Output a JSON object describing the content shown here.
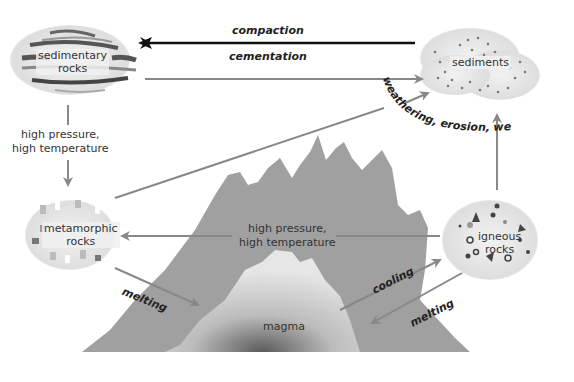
{
  "nodes": {
    "sedimentary": {
      "label_line1": "sedimentary",
      "label_line2": "rocks"
    },
    "sediments": {
      "label": "sediments"
    },
    "metamorphic": {
      "label_line1": "metamorphic",
      "label_line2": "rocks"
    },
    "igneous": {
      "label_line1": "igneous",
      "label_line2": "rocks"
    },
    "magma": {
      "label": "magma"
    }
  },
  "processes": {
    "compaction": "compaction",
    "cementation": "cementation",
    "weathering_arc": "weathering, erosion, weathering",
    "sed_to_meta_line1": "high pressure,",
    "sed_to_meta_line2": "high temperature",
    "ign_to_meta_line1": "high pressure,",
    "ign_to_meta_line2": "high temperature",
    "meta_melting": "melting",
    "cooling": "cooling",
    "ign_melting": "melting"
  },
  "colors": {
    "arrow_dark": "#111111",
    "arrow_gray": "#888888",
    "mountain_outer": "#9a9a9a",
    "mountain_inner": "#d8d8d8",
    "magma_core": "#555555"
  }
}
